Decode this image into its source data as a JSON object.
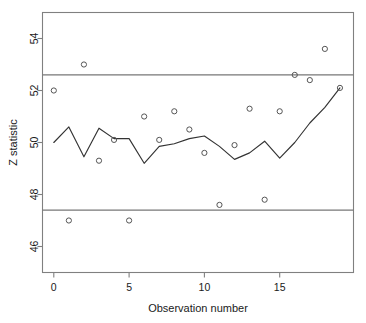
{
  "chart_data": {
    "type": "scatter",
    "title": "",
    "subtitle": "",
    "xlabel": "Observation number",
    "ylabel": "Z statistic",
    "xlim": [
      -0.75,
      19.9
    ],
    "ylim": [
      45.0,
      55.0
    ],
    "xticks": [
      0,
      5,
      10,
      15
    ],
    "yticks": [
      46,
      48,
      50,
      52,
      54
    ],
    "grid": false,
    "legend": null,
    "x": [
      0,
      1,
      2,
      3,
      4,
      5,
      6,
      7,
      8,
      9,
      10,
      11,
      12,
      13,
      14,
      15,
      16,
      17,
      18,
      19
    ],
    "series": [
      {
        "name": "Z statistic observations",
        "type": "scatter",
        "marker": "open-circle",
        "values": [
          52.0,
          47.0,
          53.0,
          49.3,
          50.1,
          47.0,
          51.0,
          50.1,
          51.2,
          50.5,
          49.6,
          47.6,
          49.9,
          51.3,
          47.8,
          51.2,
          52.6,
          52.4,
          53.6,
          52.1
        ]
      },
      {
        "name": "Smoothed trend",
        "type": "line",
        "values": [
          50.0,
          50.6,
          49.45,
          50.55,
          50.15,
          50.15,
          49.2,
          49.85,
          49.95,
          50.15,
          50.25,
          49.85,
          49.35,
          49.6,
          50.05,
          49.4,
          50.0,
          50.75,
          51.35,
          52.1
        ]
      }
    ],
    "reference_lines": [
      {
        "name": "upper-control-limit",
        "orientation": "horizontal",
        "value": 52.6
      },
      {
        "name": "lower-control-limit",
        "orientation": "horizontal",
        "value": 47.4
      }
    ],
    "colors": {
      "frame": "#808080",
      "marker": "#555555",
      "line": "#333333",
      "reference_line": "#777777",
      "text": "#1a1a1a",
      "background": "#ffffff"
    }
  }
}
